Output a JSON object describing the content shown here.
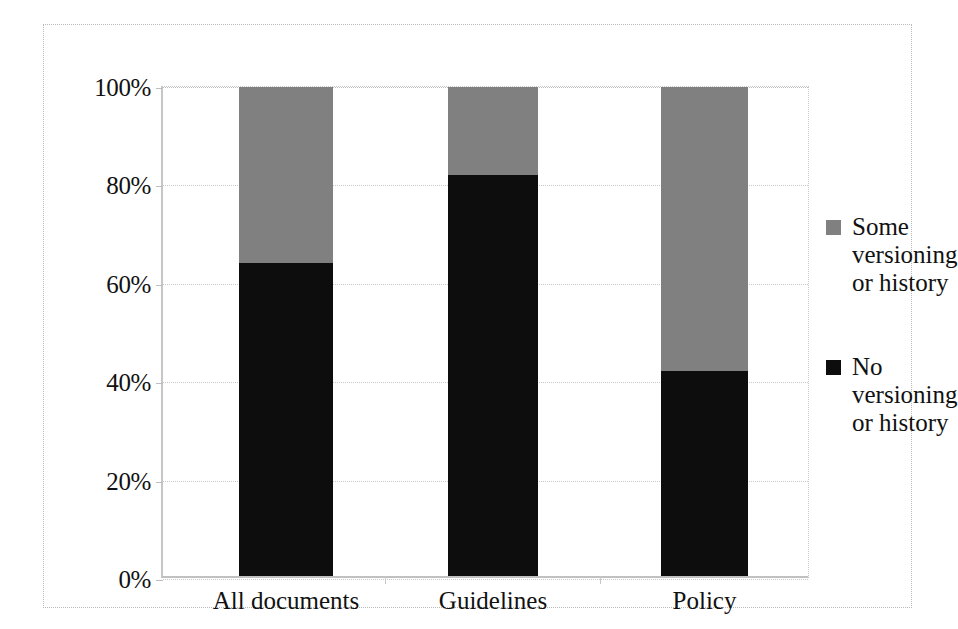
{
  "chart_data": {
    "type": "bar",
    "subtype": "stacked-100-percent",
    "title": "",
    "subtitle": "",
    "xlabel": "",
    "ylabel": "",
    "categories": [
      "All documents",
      "Guidelines",
      "Policy"
    ],
    "series": [
      {
        "name": "No versioning or history",
        "color": "#0d0d0d",
        "values": [
          64,
          82,
          42
        ]
      },
      {
        "name": "Some versioning or history",
        "color": "#808080",
        "values": [
          36,
          18,
          58
        ]
      }
    ],
    "ylim": [
      0,
      100
    ],
    "yticks": [
      0,
      20,
      40,
      60,
      80,
      100
    ],
    "ytick_labels": [
      "0%",
      "20%",
      "40%",
      "60%",
      "80%",
      "100%"
    ],
    "grid": true,
    "grid_axis": "y",
    "legend_position": "right",
    "stack_order": [
      "No versioning or history",
      "Some versioning or history"
    ],
    "annotations": []
  },
  "axes": {
    "y": {
      "ticks": [
        {
          "label": "100%",
          "value": 100
        },
        {
          "label": "80%",
          "value": 80
        },
        {
          "label": "60%",
          "value": 60
        },
        {
          "label": "40%",
          "value": 40
        },
        {
          "label": "20%",
          "value": 20
        },
        {
          "label": "0%",
          "value": 0
        }
      ]
    },
    "x": {
      "ticks": [
        {
          "label": "All documents"
        },
        {
          "label": "Guidelines"
        },
        {
          "label": "Policy"
        }
      ]
    }
  },
  "legend": {
    "items": [
      {
        "label": "Some versioning or history",
        "color": "#808080",
        "swatch": "legend-swatch-gray"
      },
      {
        "label": "No versioning or history",
        "color": "#0d0d0d",
        "swatch": "legend-swatch-black"
      }
    ]
  },
  "colors": {
    "some_versioning": "#808080",
    "no_versioning": "#0d0d0d",
    "gridline": "#c9c9c9",
    "frame": "#b9b9b9",
    "background": "#ffffff"
  }
}
